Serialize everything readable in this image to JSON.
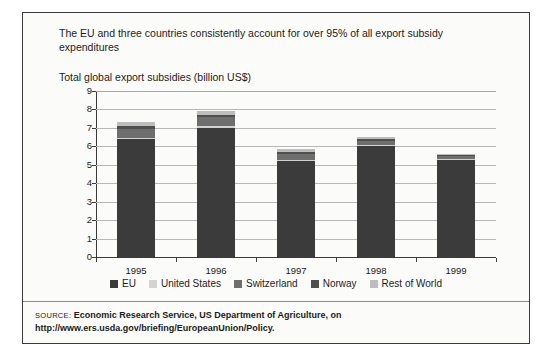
{
  "figure": {
    "headline": "The EU and three countries consistently account for over 95% of all export subsidy expenditures",
    "subtitle": "Total global export subsidies (billion US$)"
  },
  "source": {
    "label": "SOURCE:",
    "text": "Economic Research Service, US Department of Agriculture, on http://www.ers.usda.gov/briefing/EuropeanUnion/Policy."
  },
  "chart_data": {
    "type": "bar",
    "stacked": true,
    "title": "Total global export subsidies (billion US$)",
    "xlabel": "",
    "ylabel": "",
    "ylim": [
      0,
      9
    ],
    "ytick_step": 1,
    "yticks": [
      "0",
      "1",
      "2",
      "3",
      "4",
      "5",
      "6",
      "7",
      "8",
      "9"
    ],
    "grid": true,
    "legend_position": "bottom",
    "categories": [
      "1995",
      "1996",
      "1997",
      "1998",
      "1999"
    ],
    "series": [
      {
        "name": "EU",
        "color": "#3b3b3b",
        "values": [
          6.4,
          7.0,
          5.2,
          6.0,
          5.3
        ]
      },
      {
        "name": "United States",
        "color": "#d2d2d2",
        "values": [
          0.05,
          0.12,
          0.06,
          0.06,
          0.04
        ]
      },
      {
        "name": "Switzerland",
        "color": "#6e6e6e",
        "values": [
          0.5,
          0.45,
          0.35,
          0.25,
          0.12
        ]
      },
      {
        "name": "Norway",
        "color": "#4f4f4f",
        "values": [
          0.15,
          0.15,
          0.1,
          0.08,
          0.05
        ]
      },
      {
        "name": "Rest of World",
        "color": "#bdbdbd",
        "values": [
          0.2,
          0.18,
          0.12,
          0.11,
          0.09
        ]
      }
    ],
    "totals": [
      7.3,
      7.9,
      5.83,
      6.5,
      5.6
    ]
  }
}
